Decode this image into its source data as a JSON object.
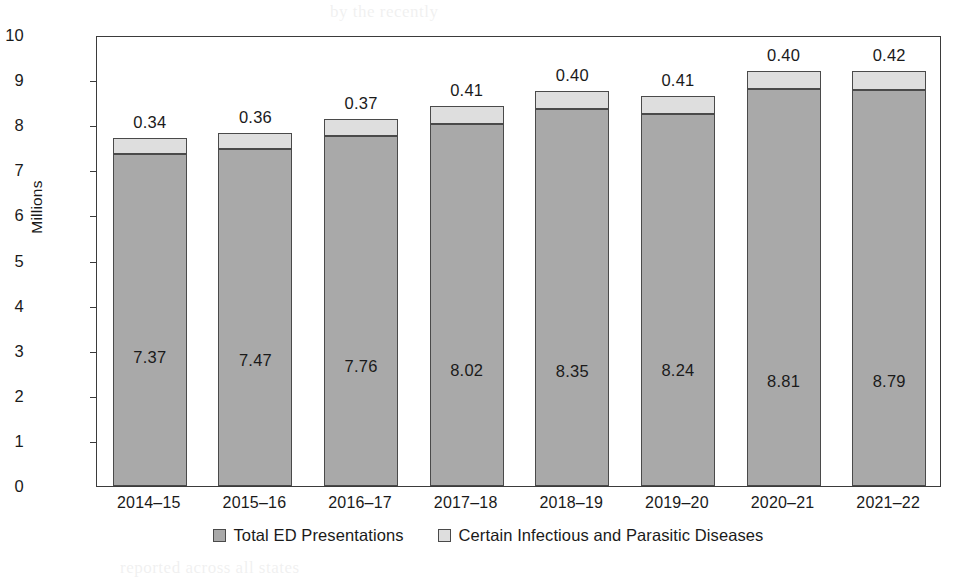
{
  "chart_data": {
    "type": "bar",
    "subtype": "stacked-bar",
    "title": "",
    "subtitle": "",
    "xlabel": "",
    "ylabel": "Millions",
    "ylim": [
      0,
      10
    ],
    "y_ticks": [
      "0",
      "1",
      "2",
      "3",
      "4",
      "5",
      "6",
      "7",
      "8",
      "9",
      "10"
    ],
    "grid": false,
    "legend_position": "bottom",
    "categories": [
      "2014–15",
      "2015–16",
      "2016–17",
      "2017–18",
      "2018–19",
      "2019–20",
      "2020–21",
      "2021–22"
    ],
    "series": [
      {
        "name": "Total ED Presentations",
        "color": "#a9a9a9",
        "values": [
          7.37,
          7.47,
          7.76,
          8.02,
          8.35,
          8.24,
          8.81,
          8.79
        ],
        "labels": [
          "7.37",
          "7.47",
          "7.76",
          "8.02",
          "8.35",
          "8.24",
          "8.81",
          "8.79"
        ]
      },
      {
        "name": "Certain Infectious and Parasitic Diseases",
        "color": "#dedede",
        "values": [
          0.34,
          0.36,
          0.37,
          0.41,
          0.4,
          0.41,
          0.4,
          0.42
        ],
        "labels": [
          "0.34",
          "0.36",
          "0.37",
          "0.41",
          "0.40",
          "0.41",
          "0.40",
          "0.42"
        ]
      }
    ],
    "totals": [
      7.71,
      7.83,
      8.13,
      8.43,
      8.75,
      8.65,
      9.21,
      9.21
    ]
  },
  "legend": {
    "items": [
      {
        "label": "Total ED Presentations",
        "color": "#a9a9a9"
      },
      {
        "label": "Certain Infectious and Parasitic Diseases",
        "color": "#dedede"
      }
    ]
  },
  "axes": {
    "y_title": "Millions"
  },
  "artifacts": {
    "bleed_top": "by the recently",
    "bleed_mid_left": "of the data",
    "bleed_mid_right": "in presentations",
    "bleed_bottom": "reported across all states"
  }
}
